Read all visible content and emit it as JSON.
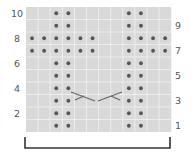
{
  "chart_title": "Knitting cable chart",
  "grid": {
    "columns": 12,
    "rows": 10,
    "cell_color": "#d9d9d9",
    "line_color": "#f2f2f2",
    "dot_color": "#555555"
  },
  "row_labels_left": [
    "10",
    "8",
    "6",
    "4",
    "2"
  ],
  "row_labels_right": [
    "9",
    "7",
    "5",
    "3",
    "1"
  ],
  "purl_dots": {
    "row_1": [
      3,
      4,
      9,
      10
    ],
    "row_2": [
      3,
      4,
      9,
      10
    ],
    "row_3": [
      3,
      4,
      9,
      10
    ],
    "row_4": [
      3,
      4,
      9,
      10
    ],
    "row_5": [
      3,
      4,
      9,
      10
    ],
    "row_6": [
      3,
      4,
      9,
      10
    ],
    "row_7": [
      1,
      2,
      3,
      4,
      5,
      6,
      9,
      10,
      11,
      12
    ],
    "row_8": [
      1,
      2,
      3,
      4,
      5,
      6,
      9,
      10,
      11,
      12
    ],
    "row_9": [
      3,
      4,
      9,
      10
    ],
    "row_10": [
      3,
      4,
      9,
      10
    ]
  },
  "cables": [
    {
      "row": 3,
      "columns": [
        5,
        6
      ],
      "type": "right-cross-icon"
    },
    {
      "row": 3,
      "columns": [
        7,
        8
      ],
      "type": "left-cross-icon"
    }
  ],
  "repeat_bracket": {
    "from_column": 1,
    "to_column": 12,
    "color": "#333333"
  }
}
